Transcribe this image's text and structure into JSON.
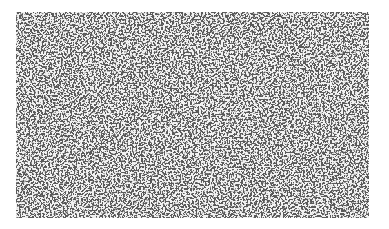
{
  "image": {
    "description": "Grayscale speckle / noise texture photograph",
    "background_color": "#ffffff",
    "texture": {
      "x": 16,
      "y": 12,
      "width": 353,
      "height": 206,
      "dark_color": "#5a5a5a",
      "light_color": "#f2f2f2",
      "dark_fraction": 0.62
    }
  }
}
